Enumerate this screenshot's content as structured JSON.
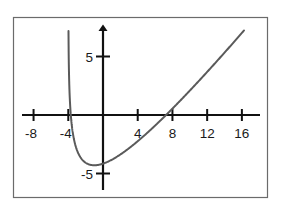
{
  "chart_data": {
    "type": "line",
    "title": "",
    "xlabel": "",
    "ylabel": "",
    "function_estimate": "y = x - 3 ln(x + 4)",
    "vertical_asymptote_x": -4,
    "minimum": {
      "x": -1,
      "y": -4.3
    },
    "x_intercept": 7.3,
    "y_intercept": -4.16,
    "x_ticks": [
      -8,
      -4,
      4,
      8,
      12,
      16
    ],
    "x_tick_labels": [
      "-8",
      "-4",
      "4",
      "8",
      "12",
      "16"
    ],
    "y_ticks": [
      5,
      -5
    ],
    "y_tick_labels": [
      "5",
      "-5"
    ],
    "xlim": [
      -9,
      18
    ],
    "ylim": [
      -6.5,
      7.5
    ],
    "grid": false,
    "legend": null,
    "series": [
      {
        "name": "f(x)",
        "x": [
          -3.97,
          -3.9,
          -3.8,
          -3.6,
          -3.3,
          -3,
          -2.5,
          -2,
          -1.5,
          -1,
          -0.5,
          0,
          1,
          2,
          3,
          4,
          6,
          8,
          10,
          12,
          14,
          16
        ],
        "y": [
          7.5,
          3.0,
          1.03,
          -0.85,
          -2.23,
          -3.0,
          -3.72,
          -4.08,
          -4.25,
          -4.3,
          -4.26,
          -4.16,
          -3.83,
          -3.38,
          -2.84,
          -2.24,
          -0.91,
          0.55,
          2.08,
          3.68,
          5.33,
          7.01
        ]
      }
    ]
  },
  "axes": {
    "x_tick_labels": [
      "-8",
      "-4",
      "4",
      "8",
      "12",
      "16"
    ],
    "y_tick_labels": [
      "5",
      "-5"
    ]
  },
  "colors": {
    "curve": "#5a5a5a",
    "axes": "#111111",
    "frame": "#6b6b6b",
    "background": "#ffffff"
  }
}
